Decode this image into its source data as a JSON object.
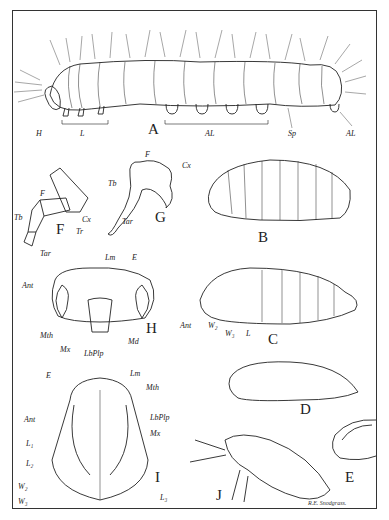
{
  "plate": {
    "signature": "R.E. Snodgrass."
  },
  "figures": {
    "A": {
      "letter": "A",
      "subject": "caterpillar larva",
      "labels": {
        "H": "H",
        "L": "L",
        "AL": "AL",
        "Sp": "Sp",
        "AL2": "AL"
      }
    },
    "B": {
      "letter": "B",
      "subject": "grub larva"
    },
    "C": {
      "letter": "C",
      "subject": "pupa side view",
      "labels": {
        "Ant": "Ant",
        "W2": "W₂",
        "W3": "W₃",
        "L": "L"
      }
    },
    "D": {
      "letter": "D",
      "subject": "pupa in cocoon"
    },
    "E": {
      "letter": "E",
      "subject": "cocoon"
    },
    "F": {
      "letter": "F",
      "subject": "thoracic leg",
      "labels": {
        "F": "F",
        "Tb": "Tb",
        "Tar": "Tar",
        "Tr": "Tr",
        "Cx": "Cx"
      }
    },
    "G": {
      "letter": "G",
      "subject": "larval leg",
      "labels": {
        "F": "F",
        "Cx": "Cx",
        "Tb": "Tb",
        "Tar": "Tar"
      }
    },
    "H": {
      "letter": "H",
      "subject": "larval head front",
      "labels": {
        "Lm": "Lm",
        "E": "E",
        "Ant": "Ant",
        "Mth": "Mth",
        "Mx": "Mx",
        "LbPlp": "LbPlp",
        "Md": "Md"
      }
    },
    "I": {
      "letter": "I",
      "subject": "pupa ventral view",
      "labels": {
        "E": "E",
        "Lm": "Lm",
        "Mth": "Mth",
        "LbPlp": "LbPlp",
        "Ant": "Ant",
        "Mx": "Mx",
        "L1": "L₁",
        "L2": "L₂",
        "W2": "W₂",
        "W3": "W₃",
        "L3": "L₃"
      }
    },
    "J": {
      "letter": "J",
      "subject": "adult moth"
    }
  },
  "colors": {
    "ink": "#222222",
    "paper": "#ffffff",
    "frame": "#333333"
  }
}
